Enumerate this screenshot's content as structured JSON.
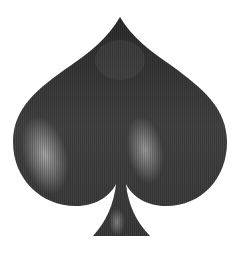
{
  "image": {
    "subject": "spade playing-card suit symbol",
    "alt": "Glossy black spade symbol with vertical scanline texture",
    "colors": {
      "background": "#ffffff",
      "body_dark": "#2a2a2a",
      "body_mid": "#4a4a4a",
      "highlight": "#a0a0a0"
    }
  }
}
